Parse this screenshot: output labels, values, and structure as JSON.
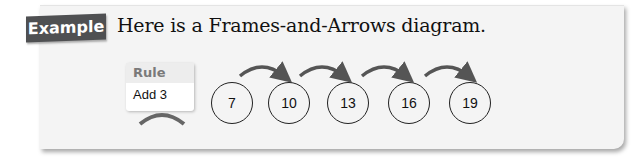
{
  "example_label": "Example",
  "title": "Here is a Frames-and-Arrows diagram.",
  "rule": {
    "header": "Rule",
    "value": "Add 3"
  },
  "frames": [
    "7",
    "10",
    "13",
    "16",
    "19"
  ],
  "colors": {
    "tag_bg": "#4f5052",
    "panel_bg": "#f4f4f4",
    "arrow": "#555555"
  }
}
